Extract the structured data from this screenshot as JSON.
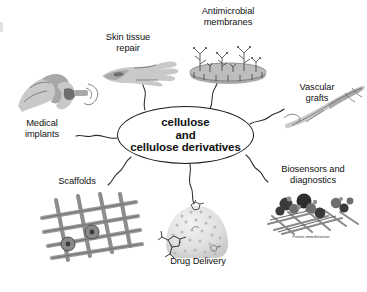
{
  "figure": {
    "center": {
      "line1": "cellulose",
      "line2": "and",
      "line3": "cellulose derivatives"
    },
    "nodes": [
      {
        "id": "medical-implants",
        "label": "Medical\nimplants",
        "illustration": "bone-joint-implant"
      },
      {
        "id": "skin-tissue-repair",
        "label": "Skin tissue\nrepair",
        "illustration": "hand-forearm"
      },
      {
        "id": "antimicrobial-membranes",
        "label": "Antimicrobial\nmembranes",
        "illustration": "membrane-disc-with-grafted-chains"
      },
      {
        "id": "vascular-grafts",
        "label": "Vascular\ngrafts",
        "illustration": "tubular-vascular-graft"
      },
      {
        "id": "biosensors-and-diagnostics",
        "label": "Biosensors and\ndiagnostics",
        "illustration": "protein-on-fiber-mesh",
        "sub_caption": "Protein immobilization"
      },
      {
        "id": "drug-delivery",
        "label": "Drug Delivery",
        "illustration": "porous-nanosphere-carrier"
      },
      {
        "id": "scaffolds",
        "label": "Scaffolds",
        "illustration": "woven-fiber-scaffold"
      }
    ],
    "colors": {
      "background": "#ffffff",
      "text": "#111111",
      "stroke": "#2b2b2b",
      "illustration_gray": "#a8a8a8"
    }
  }
}
